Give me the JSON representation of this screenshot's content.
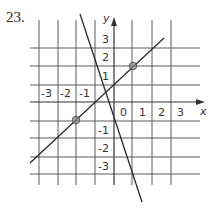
{
  "problem_number": "23.",
  "graph": {
    "x_axis_label": "x",
    "y_axis_label": "y",
    "x_ticks": [
      "-3",
      "-2",
      "-1",
      "0",
      "1",
      "2",
      "3"
    ],
    "y_ticks": [
      "3",
      "2",
      "1",
      "-1",
      "-2",
      "-3"
    ],
    "colors": {
      "grid": "#5a5a5a",
      "line": "#2a2a2a",
      "point_fill": "#8a8a8a"
    },
    "lines": [
      {
        "name": "positive-slope-line",
        "passes_through_marked_points": true
      },
      {
        "name": "negative-slope-line",
        "steep": true
      }
    ],
    "points": [
      {
        "name": "upper-point"
      },
      {
        "name": "lower-point"
      }
    ]
  }
}
